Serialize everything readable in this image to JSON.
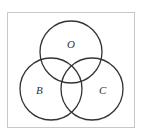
{
  "diagram": {
    "type": "venn",
    "sets": [
      {
        "id": "O",
        "label": "O",
        "cx": 71,
        "cy": 52,
        "r": 31
      },
      {
        "id": "B",
        "label": "B",
        "cx": 51,
        "cy": 89,
        "r": 31
      },
      {
        "id": "C",
        "label": "C",
        "cx": 92,
        "cy": 89,
        "r": 31
      }
    ],
    "labels": {
      "O": "O",
      "B": "B",
      "C": "C"
    },
    "colors": {
      "frame": "#c8c8c8",
      "stroke": "#333333",
      "background": "#ffffff"
    }
  }
}
